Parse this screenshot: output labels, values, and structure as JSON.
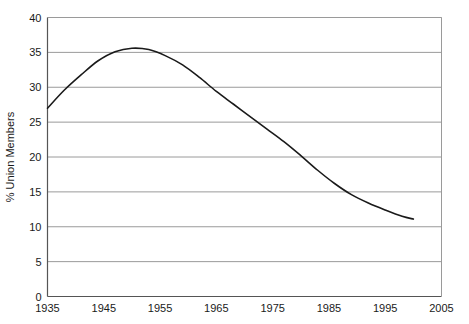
{
  "chart_data": {
    "type": "line",
    "title": "",
    "subtitle": "",
    "xlabel": "",
    "ylabel": "% Union Members",
    "xlim": [
      1935,
      2005
    ],
    "ylim": [
      0,
      40
    ],
    "grid": true,
    "legend": false,
    "x_ticks": [
      "1935",
      "1945",
      "1955",
      "1965",
      "1975",
      "1985",
      "1995",
      "2005"
    ],
    "x_tick_values": [
      1935,
      1945,
      1955,
      1965,
      1975,
      1985,
      1995,
      2005
    ],
    "y_ticks": [
      "0",
      "5",
      "10",
      "15",
      "20",
      "25",
      "30",
      "35",
      "40"
    ],
    "y_tick_values": [
      0,
      5,
      10,
      15,
      20,
      25,
      30,
      35,
      40
    ],
    "series": [
      {
        "name": "% Union Members",
        "color": "#1a1a1a",
        "x": [
          1935,
          1938,
          1941,
          1944,
          1947,
          1950,
          1953,
          1956,
          1959,
          1962,
          1965,
          1968,
          1971,
          1974,
          1977,
          1980,
          1983,
          1986,
          1989,
          1992,
          1995,
          1998,
          2000
        ],
        "values": [
          27.0,
          29.6,
          31.8,
          33.8,
          35.1,
          35.6,
          35.4,
          34.5,
          33.2,
          31.4,
          29.4,
          27.6,
          25.8,
          24.0,
          22.2,
          20.2,
          18.1,
          16.2,
          14.6,
          13.4,
          12.4,
          11.5,
          11.1
        ]
      }
    ],
    "annotations": []
  },
  "plot": {
    "background_color": "#ffffff",
    "grid_color": "#9a9a9a",
    "axis_color": "#6e6e6e",
    "line_color": "#1a1a1a"
  }
}
